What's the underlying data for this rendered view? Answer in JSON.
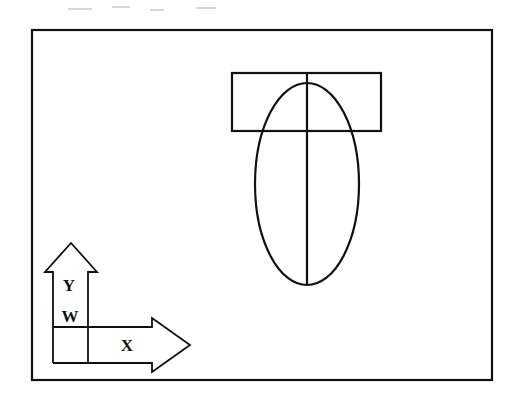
{
  "figure": {
    "background_color": "#ffffff",
    "stroke_color": "#101010",
    "canvas": {
      "width": 515,
      "height": 410
    }
  },
  "frame": {
    "name": "drawing-border",
    "x": 32,
    "y": 30,
    "width": 460,
    "height": 350,
    "stroke_width": 2.2
  },
  "shapes": {
    "rectangle": {
      "label": "top-flange-rectangle",
      "x": 232,
      "y": 73,
      "width": 149,
      "height": 58,
      "stroke_width": 2.2
    },
    "ellipse": {
      "label": "body-ellipse",
      "cx": 307,
      "cy": 184,
      "rx": 52,
      "ry": 101,
      "stroke_width": 2.2
    },
    "centerline": {
      "label": "vertical-centerline",
      "x": 307,
      "y1": 73,
      "y2": 285,
      "stroke_width": 2.2
    }
  },
  "axes": {
    "y_arrow": {
      "label": "Y",
      "label_x": 69,
      "label_y": 287,
      "shaft_left": 53,
      "shaft_right": 88,
      "shaft_bottom": 363,
      "head_base_y": 272,
      "head_left": 45,
      "head_right": 97,
      "tip_x": 71,
      "tip_y": 243,
      "stroke_width": 1.8
    },
    "x_arrow": {
      "label": "X",
      "label_x": 127,
      "label_y": 347,
      "shaft_top": 327,
      "shaft_bottom": 363,
      "shaft_left": 53,
      "head_base_x": 152,
      "head_top": 318,
      "head_bottom": 372,
      "tip_x": 190,
      "tip_y": 345,
      "stroke_width": 1.8
    },
    "origin": {
      "label": "W",
      "label_x": 70,
      "label_y": 318,
      "corner_x": 53,
      "corner_y": 327
    }
  },
  "labels": [
    {
      "text": "Y",
      "name": "axis-label-y"
    },
    {
      "text": "W",
      "name": "axis-label-w"
    },
    {
      "text": "X",
      "name": "axis-label-x"
    }
  ],
  "artifacts": {
    "scan_specks": [
      {
        "x": 68,
        "y": 8,
        "w": 24,
        "h": 2
      },
      {
        "x": 112,
        "y": 6,
        "w": 18,
        "h": 2
      },
      {
        "x": 150,
        "y": 9,
        "w": 14,
        "h": 2
      },
      {
        "x": 196,
        "y": 7,
        "w": 20,
        "h": 2
      }
    ]
  }
}
